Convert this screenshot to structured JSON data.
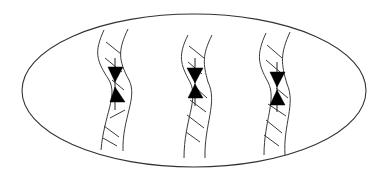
{
  "diagram": {
    "colors": {
      "background": "#ffffff",
      "outline": "#333333",
      "fill_marker": "#000000"
    },
    "ellipse": {
      "cx": 194,
      "cy": 90.5,
      "rx": 172,
      "ry": 76.5
    },
    "strands": [
      {
        "id": "strand-1",
        "left_path": "M104,30 C94,52 96,60 109,80 C118,96 104,115 101,150",
        "right_path": "M128,29 C118,50 118,60 129,80 C138,98 122,118 123,151",
        "hatches": [
          [
            106,
            42,
            121,
            54
          ],
          [
            105,
            58,
            122,
            72
          ],
          [
            112,
            80,
            124,
            90
          ],
          [
            110,
            118,
            125,
            110
          ],
          [
            104,
            126,
            119,
            137
          ],
          [
            103,
            138,
            117,
            146
          ]
        ],
        "marker": {
          "down_triangle": "108,67 123,67 115,82",
          "up_triangle": "115,87 110,102 125,102",
          "axis": [
            115,
            58,
            115,
            110
          ]
        }
      },
      {
        "id": "strand-2",
        "left_path": "M188,35 C178,55 180,64 190,82 C199,100 184,120 184,158",
        "right_path": "M212,35 C202,55 203,64 208,82 C218,102 204,125 205,158",
        "hatches": [
          [
            189,
            46,
            204,
            58
          ],
          [
            188,
            62,
            202,
            74
          ],
          [
            196,
            88,
            207,
            98
          ],
          [
            190,
            100,
            206,
            112
          ],
          [
            187,
            115,
            204,
            128
          ],
          [
            186,
            132,
            200,
            142
          ]
        ],
        "marker": {
          "down_triangle": "187,68 203,68 195,83",
          "up_triangle": "195,84 188,98 203,98",
          "axis": [
            195,
            58,
            195,
            106
          ]
        }
      },
      {
        "id": "strand-3",
        "left_path": "M266,33 C256,55 258,64 268,82 C277,100 264,120 264,155",
        "right_path": "M290,32 C280,54 281,64 287,84 C296,104 283,125 285,155",
        "hatches": [
          [
            267,
            45,
            282,
            58
          ],
          [
            266,
            60,
            280,
            72
          ],
          [
            276,
            88,
            288,
            98
          ],
          [
            268,
            104,
            286,
            116
          ],
          [
            266,
            120,
            282,
            133
          ],
          [
            264,
            135,
            279,
            146
          ]
        ],
        "marker": {
          "down_triangle": "270,72 285,72 277,87",
          "up_triangle": "277,90 270,105 285,105",
          "axis": [
            277,
            62,
            277,
            112
          ]
        }
      }
    ]
  }
}
